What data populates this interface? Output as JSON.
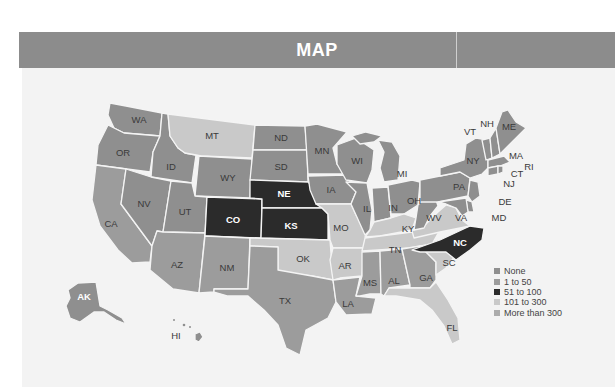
{
  "header": {
    "title": "MAP"
  },
  "colors": {
    "header_bg": "#8c8c8c",
    "none": "#8f8f8f",
    "1_to_50": "#9c9c9c",
    "51_to_100": "#2b2b2b",
    "101_to_300": "#c9c9c9",
    "more_than_300": "#ababab"
  },
  "legend": {
    "items": [
      {
        "label": "None",
        "color": "#8f8f8f"
      },
      {
        "label": "1 to 50",
        "color": "#9c9c9c"
      },
      {
        "label": "51 to 100",
        "color": "#2b2b2b"
      },
      {
        "label": "101 to 300",
        "color": "#c9c9c9"
      },
      {
        "label": "More than 300",
        "color": "#ababab"
      }
    ]
  },
  "states": {
    "WA": "WA",
    "OR": "OR",
    "CA": "CA",
    "ID": "ID",
    "NV": "NV",
    "MT": "MT",
    "WY": "WY",
    "UT": "UT",
    "AZ": "AZ",
    "CO": "CO",
    "NM": "NM",
    "ND": "ND",
    "SD": "SD",
    "NE": "NE",
    "KS": "KS",
    "OK": "OK",
    "TX": "TX",
    "MN": "MN",
    "IA": "IA",
    "MO": "MO",
    "AR": "AR",
    "LA": "LA",
    "WI": "WI",
    "IL": "IL",
    "MI": "MI",
    "IN": "IN",
    "OH": "OH",
    "KY": "KY",
    "TN": "TN",
    "MS": "MS",
    "AL": "AL",
    "GA": "GA",
    "FL": "FL",
    "SC": "SC",
    "NC": "NC",
    "VA": "VA",
    "WV": "WV",
    "PA": "PA",
    "NY": "NY",
    "VT": "VT",
    "NH": "NH",
    "ME": "ME",
    "MA": "MA",
    "RI": "RI",
    "CT": "CT",
    "NJ": "NJ",
    "DE": "DE",
    "MD": "MD",
    "AK": "AK",
    "HI": "HI"
  }
}
